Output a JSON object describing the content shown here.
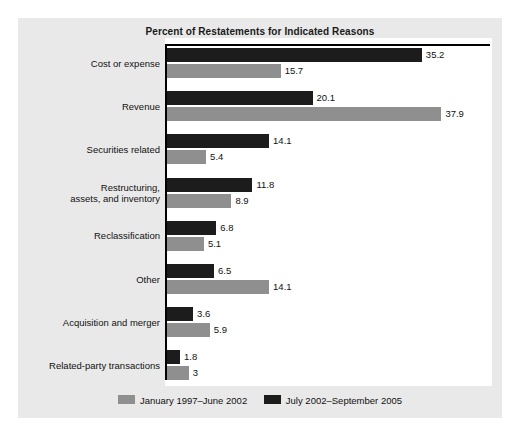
{
  "chart_data": {
    "type": "bar",
    "orientation": "horizontal",
    "title": "Percent of Restatements for Indicated Reasons",
    "xlabel": "",
    "ylabel": "",
    "xlim": [
      0,
      40
    ],
    "grid": false,
    "legend_position": "bottom-center",
    "categories": [
      "Cost or expense",
      "Revenue",
      "Securities related",
      "Restructuring, assets, and inventory",
      "Reclassification",
      "Other",
      "Acquisition and merger",
      "Related-party transactions"
    ],
    "series": [
      {
        "name": "July 2002–September 2005",
        "color": "#1c1c1c",
        "values": [
          35.2,
          20.1,
          14.1,
          11.8,
          6.8,
          6.5,
          3.6,
          1.8
        ],
        "labels": [
          "35.2",
          "20.1",
          "14.1",
          "11.8",
          "6.8",
          "6.5",
          "3.6",
          "1.8"
        ]
      },
      {
        "name": "January 1997–June 2002",
        "color": "#8f8f8f",
        "values": [
          15.7,
          37.9,
          5.4,
          8.9,
          5.1,
          14.1,
          5.9,
          3
        ],
        "labels": [
          "15.7",
          "37.9",
          "5.4",
          "8.9",
          "5.1",
          "14.1",
          "5.9",
          "3"
        ]
      }
    ]
  },
  "chart": {
    "title": "Percent of Restatements for Indicated Reasons",
    "groups": [
      {
        "label_line1": "Cost or expense",
        "label_line2": "",
        "recent_label": "35.2",
        "earlier_label": "15.7"
      },
      {
        "label_line1": "Revenue",
        "label_line2": "",
        "recent_label": "20.1",
        "earlier_label": "37.9"
      },
      {
        "label_line1": "Securities related",
        "label_line2": "",
        "recent_label": "14.1",
        "earlier_label": "5.4"
      },
      {
        "label_line1": "Restructuring,",
        "label_line2": "assets, and inventory",
        "recent_label": "11.8",
        "earlier_label": "8.9"
      },
      {
        "label_line1": "Reclassification",
        "label_line2": "",
        "recent_label": "6.8",
        "earlier_label": "5.1"
      },
      {
        "label_line1": "Other",
        "label_line2": "",
        "recent_label": "6.5",
        "earlier_label": "14.1"
      },
      {
        "label_line1": "Acquisition and merger",
        "label_line2": "",
        "recent_label": "3.6",
        "earlier_label": "5.9"
      },
      {
        "label_line1": "Related-party transactions",
        "label_line2": "",
        "recent_label": "1.8",
        "earlier_label": "3"
      }
    ],
    "legend": {
      "earlier_label": "January 1997–June 2002",
      "recent_label": "July 2002–September 2005"
    },
    "colors": {
      "recent": "#1c1c1c",
      "earlier": "#8f8f8f",
      "panel": "#e9e9e9",
      "plot": "#ffffff",
      "axis": "#000000",
      "text": "#111111"
    }
  }
}
